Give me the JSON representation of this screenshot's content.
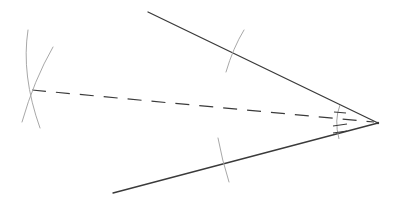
{
  "diagram": {
    "type": "angle-bisector-construction",
    "background": "#ffffff",
    "colors": {
      "line": "#3a3a3a",
      "construction_arc": "#a8a8a8"
    },
    "vertex": {
      "x": 378,
      "y": 123
    },
    "rays": [
      {
        "name": "upper-ray",
        "from": [
          378,
          123
        ],
        "to": [
          148,
          12
        ]
      },
      {
        "name": "lower-ray",
        "from": [
          378,
          123
        ],
        "to": [
          113,
          193
        ]
      }
    ],
    "bisector": {
      "from": [
        378,
        123
      ],
      "to": [
        32,
        90
      ],
      "style": "dashed"
    },
    "construction_arcs": [
      {
        "name": "arc-on-upper-ray",
        "center_hint": "vertex",
        "crosses_at": [
          234,
          52
        ]
      },
      {
        "name": "arc-on-lower-ray",
        "center_hint": "vertex",
        "crosses_at": [
          223,
          155
        ]
      },
      {
        "name": "intersection-arc-1",
        "crosses_at": [
          32,
          90
        ]
      },
      {
        "name": "intersection-arc-2",
        "crosses_at": [
          32,
          90
        ]
      }
    ],
    "angle_marks": {
      "arc_near_vertex": true,
      "ticks_upper_half": 1,
      "ticks_lower_half": 2
    }
  }
}
